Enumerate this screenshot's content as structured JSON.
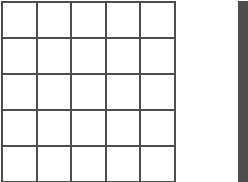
{
  "canvas": {
    "width": 248,
    "height": 182,
    "background_color": "#ffffff"
  },
  "style": {
    "line_color": "#4d4d4d",
    "line_width_px": 2,
    "cell_fill": "#ffffff"
  },
  "grids": [
    {
      "name": "primary-grid",
      "rows": 5,
      "columns": 5,
      "cell_width_px": 34.5,
      "cell_height_px": 36,
      "origin_x_px": 1,
      "origin_y_px": 1,
      "clipped_edges": [
        "bottom"
      ],
      "cells": [
        [
          "",
          "",
          "",
          "",
          ""
        ],
        [
          "",
          "",
          "",
          "",
          ""
        ],
        [
          "",
          "",
          "",
          "",
          ""
        ],
        [
          "",
          "",
          "",
          "",
          ""
        ],
        [
          "",
          "",
          "",
          "",
          ""
        ]
      ]
    },
    {
      "name": "secondary-grid",
      "rows": 5,
      "columns": 5,
      "cell_width_px": 34.5,
      "cell_height_px": 36,
      "origin_x_px": 238,
      "origin_y_px": 1,
      "clipped_edges": [
        "right",
        "bottom"
      ],
      "cells": [
        [
          "",
          "",
          "",
          "",
          ""
        ],
        [
          "",
          "",
          "",
          "",
          ""
        ],
        [
          "",
          "",
          "",
          "",
          ""
        ],
        [
          "",
          "",
          "",
          "",
          ""
        ],
        [
          "",
          "",
          "",
          "",
          ""
        ]
      ]
    }
  ]
}
